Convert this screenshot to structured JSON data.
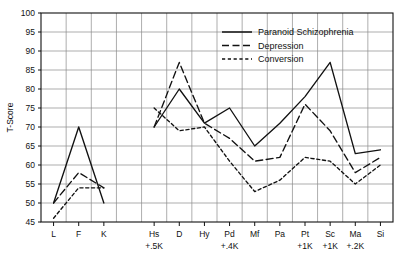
{
  "chart_data": {
    "type": "line",
    "title": "",
    "xlabel": "",
    "ylabel": "T-Score",
    "ylim": [
      45,
      100
    ],
    "ytick_step": 5,
    "yticks": [
      45,
      50,
      55,
      60,
      65,
      70,
      75,
      80,
      85,
      90,
      95,
      100
    ],
    "grid": true,
    "legend_position": "top-right",
    "panels": [
      {
        "name": "validity",
        "categories": [
          "L",
          "F",
          "K"
        ],
        "sublabels": [
          "",
          "",
          ""
        ]
      },
      {
        "name": "clinical",
        "categories": [
          "Hs",
          "D",
          "Hy",
          "Pd",
          "Mf",
          "Pa",
          "Pt",
          "Sc",
          "Ma",
          "Si"
        ],
        "sublabels": [
          "+.5K",
          "",
          "",
          "+.4K",
          "",
          "",
          "+1K",
          "+1K",
          "+.2K",
          ""
        ]
      }
    ],
    "series": [
      {
        "name": "Paranoid Schizophrenia",
        "dash": "solid",
        "color": "#111111",
        "validity_values": [
          50,
          70,
          50
        ],
        "clinical_values": [
          70,
          80,
          71,
          75,
          65,
          71,
          78,
          87,
          63,
          64
        ]
      },
      {
        "name": "Depression",
        "dash": "long-dash",
        "color": "#111111",
        "validity_values": [
          50,
          58,
          54
        ],
        "clinical_values": [
          70,
          87,
          71,
          67,
          61,
          62,
          76,
          69,
          58,
          62
        ]
      },
      {
        "name": "Conversion",
        "dash": "short-dash",
        "color": "#111111",
        "validity_values": [
          46,
          54,
          54
        ],
        "clinical_values": [
          75,
          69,
          70,
          61,
          53,
          56,
          62,
          61,
          55,
          60
        ]
      }
    ]
  },
  "legend": {
    "items": [
      {
        "label": "Paranoid Schizophrenia",
        "dash": "solid"
      },
      {
        "label": "Depression",
        "dash": "long-dash"
      },
      {
        "label": "Conversion",
        "dash": "short-dash"
      }
    ]
  },
  "axis": {
    "ylabel": "T-Score"
  }
}
